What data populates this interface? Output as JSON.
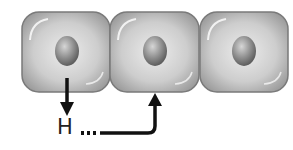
{
  "diagram": {
    "type": "cell-signaling",
    "cells": [
      {
        "id": "cell-1",
        "role": "secreting-cell"
      },
      {
        "id": "cell-2",
        "role": "target-cell"
      },
      {
        "id": "cell-3",
        "role": "neighbor-cell"
      }
    ],
    "signal_label": "H",
    "colors": {
      "cell_fill_light": "#e6e6e6",
      "cell_fill_dark": "#a8a8a8",
      "cell_border": "#7a7a7a",
      "nucleus_light": "#cfcfcf",
      "nucleus_dark": "#5e5e5e",
      "arrow": "#111111"
    }
  }
}
